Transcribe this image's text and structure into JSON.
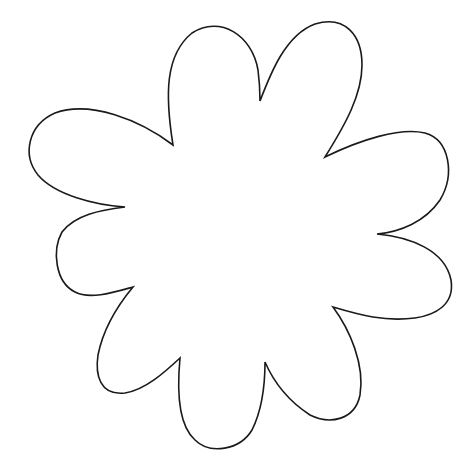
{
  "image": {
    "width": 474,
    "height": 473,
    "background": "#ffffff",
    "subject": "nine-petal flower outline",
    "stroke_color": "#1a1a1a",
    "fill_color": "#ffffff"
  },
  "flower": {
    "petal_count": 9,
    "path": "M 173 145 C 165 95, 165 55, 192 33 C 220 15, 252 35, 258 70 C 260 85, 260 95, 260 101 C 270 75, 285 35, 315 24 C 345 15, 362 35, 362 65 C 362 95, 345 125, 325 157 C 360 140, 400 127, 425 133 C 450 140, 455 175, 440 200 C 425 222, 400 232, 377 234 C 410 237, 445 250, 451 280 C 455 305, 435 315, 415 318 C 385 322, 360 315, 333 307 C 350 330, 365 365, 360 395 C 355 420, 330 425, 310 415 C 290 402, 275 385, 265 362 C 265 385, 262 410, 252 430 C 240 450, 210 455, 195 440 C 178 425, 177 390, 180 358 C 165 372, 145 390, 125 393 C 100 396, 95 375, 98 355 C 103 330, 118 305, 133 287 C 115 292, 90 300, 75 292 C 55 282, 52 250, 62 232 C 75 215, 100 210, 125 207 C 95 205, 55 195, 38 175 C 22 155, 28 125, 55 113 C 90 100, 140 120, 173 145 Z"
  }
}
